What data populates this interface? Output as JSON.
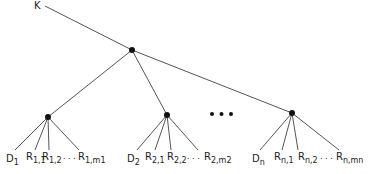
{
  "diagram": {
    "type": "tree",
    "root_label": "K",
    "ellipsis": "• • •",
    "leaf_ellipsis": ". . .",
    "groups": [
      {
        "id": "1",
        "leaves": [
          {
            "base": "D",
            "sub": "1"
          },
          {
            "base": "R",
            "sub": "1,1"
          },
          {
            "base": "R",
            "sub": "1,2"
          },
          {
            "base": "R",
            "sub": "1,m1"
          }
        ]
      },
      {
        "id": "2",
        "leaves": [
          {
            "base": "D",
            "sub": "2"
          },
          {
            "base": "R",
            "sub": "2,1"
          },
          {
            "base": "R",
            "sub": "2,2"
          },
          {
            "base": "R",
            "sub": "2,m2"
          }
        ]
      },
      {
        "id": "n",
        "leaves": [
          {
            "base": "D",
            "sub": "n"
          },
          {
            "base": "R",
            "sub": "n,1"
          },
          {
            "base": "R",
            "sub": "n,2"
          },
          {
            "base": "R",
            "sub": "n,mn"
          }
        ]
      }
    ],
    "colors": {
      "line": "#555555",
      "node": "#111111"
    }
  }
}
